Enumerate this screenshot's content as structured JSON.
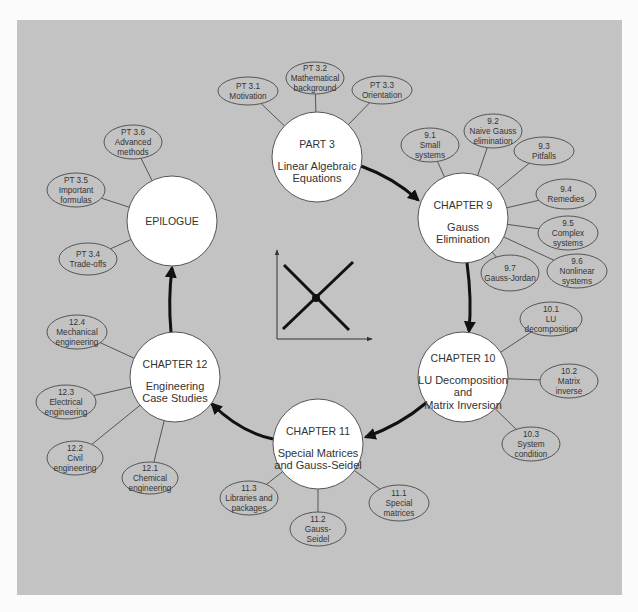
{
  "colors": {
    "panel": "#c3c3c3",
    "background": "#fbfbfb",
    "node_fill": "#ffffff",
    "stroke": "#555555",
    "arrow": "#111111",
    "text": "#333333"
  },
  "main_nodes": [
    {
      "id": "part3",
      "cx": 317,
      "cy": 157,
      "r": 45,
      "title": "PART 3",
      "lines": [
        "Linear Algebraic",
        "Equations"
      ]
    },
    {
      "id": "ch9",
      "cx": 463,
      "cy": 218,
      "r": 45,
      "title": "CHAPTER 9",
      "lines": [
        "Gauss",
        "Elimination"
      ]
    },
    {
      "id": "ch10",
      "cx": 463,
      "cy": 377,
      "r": 45,
      "title": "CHAPTER 10",
      "lines": [
        "LU Decomposition",
        "and",
        "Matrix Inversion"
      ]
    },
    {
      "id": "ch11",
      "cx": 318,
      "cy": 444,
      "r": 45,
      "title": "CHAPTER 11",
      "lines": [
        "Special Matrices",
        "and Gauss-Seidel"
      ]
    },
    {
      "id": "ch12",
      "cx": 175,
      "cy": 377,
      "r": 45,
      "title": "CHAPTER 12",
      "lines": [
        "Engineering",
        "Case Studies"
      ]
    },
    {
      "id": "epilogue",
      "cx": 172,
      "cy": 221,
      "r": 45,
      "title": "EPILOGUE",
      "lines": []
    }
  ],
  "sub_nodes": [
    {
      "parent": "part3",
      "cx": 248,
      "cy": 91,
      "rx": 30,
      "ry": 14,
      "lines": [
        "PT 3.1",
        "Motivation"
      ]
    },
    {
      "parent": "part3",
      "cx": 315,
      "cy": 78,
      "rx": 29,
      "ry": 16,
      "lines": [
        "PT 3.2",
        "Mathematical",
        "background"
      ]
    },
    {
      "parent": "part3",
      "cx": 382,
      "cy": 90,
      "rx": 30,
      "ry": 14,
      "lines": [
        "PT 3.3",
        "Orientation"
      ]
    },
    {
      "parent": "ch9",
      "cx": 430,
      "cy": 145,
      "rx": 29,
      "ry": 17,
      "lines": [
        "9.1",
        "Small",
        "systems"
      ]
    },
    {
      "parent": "ch9",
      "cx": 493,
      "cy": 131,
      "rx": 29,
      "ry": 17,
      "lines": [
        "9.2",
        "Naive Gauss",
        "elimination"
      ]
    },
    {
      "parent": "ch9",
      "cx": 544,
      "cy": 151,
      "rx": 30,
      "ry": 14,
      "lines": [
        "9.3",
        "Pitfalls"
      ]
    },
    {
      "parent": "ch9",
      "cx": 566,
      "cy": 194,
      "rx": 30,
      "ry": 15,
      "lines": [
        "9.4",
        "Remedies"
      ]
    },
    {
      "parent": "ch9",
      "cx": 568,
      "cy": 233,
      "rx": 30,
      "ry": 17,
      "lines": [
        "9.5",
        "Complex",
        "systems"
      ]
    },
    {
      "parent": "ch9",
      "cx": 577,
      "cy": 271,
      "rx": 30,
      "ry": 17,
      "lines": [
        "9.6",
        "Nonlinear",
        "systems"
      ]
    },
    {
      "parent": "ch9",
      "cx": 510,
      "cy": 273,
      "rx": 29,
      "ry": 18,
      "lines": [
        "9.7",
        "Gauss-Jordan"
      ]
    },
    {
      "parent": "ch10",
      "cx": 551,
      "cy": 319,
      "rx": 31,
      "ry": 17,
      "lines": [
        "10.1",
        "LU",
        "decomposition"
      ]
    },
    {
      "parent": "ch10",
      "cx": 569,
      "cy": 381,
      "rx": 29,
      "ry": 17,
      "lines": [
        "10.2",
        "Matrix",
        "inverse"
      ]
    },
    {
      "parent": "ch10",
      "cx": 531,
      "cy": 444,
      "rx": 29,
      "ry": 17,
      "lines": [
        "10.3",
        "System",
        "condition"
      ]
    },
    {
      "parent": "ch11",
      "cx": 399,
      "cy": 503,
      "rx": 30,
      "ry": 18,
      "lines": [
        "11.1",
        "Special",
        "matrices"
      ]
    },
    {
      "parent": "ch11",
      "cx": 318,
      "cy": 529,
      "rx": 28,
      "ry": 17,
      "lines": [
        "11.2",
        "Gauss-",
        "Seidel"
      ]
    },
    {
      "parent": "ch11",
      "cx": 249,
      "cy": 498,
      "rx": 29,
      "ry": 17,
      "lines": [
        "11.3",
        "Libraries and",
        "packages"
      ]
    },
    {
      "parent": "ch12",
      "cx": 150,
      "cy": 478,
      "rx": 28,
      "ry": 16,
      "lines": [
        "12.1",
        "Chemical",
        "engineering"
      ]
    },
    {
      "parent": "ch12",
      "cx": 75,
      "cy": 458,
      "rx": 28,
      "ry": 17,
      "lines": [
        "12.2",
        "Civil",
        "engineering"
      ]
    },
    {
      "parent": "ch12",
      "cx": 66,
      "cy": 402,
      "rx": 30,
      "ry": 17,
      "lines": [
        "12.3",
        "Electrical",
        "engineering"
      ]
    },
    {
      "parent": "ch12",
      "cx": 77,
      "cy": 332,
      "rx": 30,
      "ry": 17,
      "lines": [
        "12.4",
        "Mechanical",
        "engineering"
      ]
    },
    {
      "parent": "epilogue",
      "cx": 88,
      "cy": 259,
      "rx": 29,
      "ry": 16,
      "lines": [
        "PT 3.4",
        "Trade-offs"
      ]
    },
    {
      "parent": "epilogue",
      "cx": 76,
      "cy": 190,
      "rx": 29,
      "ry": 17,
      "lines": [
        "PT 3.5",
        "Important",
        "formulas"
      ]
    },
    {
      "parent": "epilogue",
      "cx": 133,
      "cy": 142,
      "rx": 29,
      "ry": 17,
      "lines": [
        "PT 3.6",
        "Advanced",
        "methods"
      ]
    }
  ],
  "flow_arrows": [
    {
      "from": "part3",
      "to": "ch9",
      "path": "M 361 166 Q 394 178 418 200"
    },
    {
      "from": "ch9",
      "to": "ch10",
      "path": "M 467 263 Q 472 300 469 331"
    },
    {
      "from": "ch10",
      "to": "ch11",
      "path": "M 426 403 Q 400 425 366 437"
    },
    {
      "from": "ch11",
      "to": "ch12",
      "path": "M 273 439 Q 240 432 212 404"
    },
    {
      "from": "ch12",
      "to": "epilogue",
      "path": "M 171 332 Q 168 300 172 268"
    }
  ],
  "center_icon": {
    "name": "linear-equations-graph",
    "y_axis": [
      277,
      339,
      277,
      250
    ],
    "x_axis": [
      277,
      339,
      372,
      339
    ],
    "line_a": [
      284,
      265,
      349,
      330
    ],
    "line_b": [
      283,
      329,
      353,
      262
    ],
    "intersection": [
      316,
      298
    ]
  }
}
